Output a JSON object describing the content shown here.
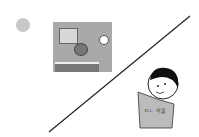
{
  "step_number": "3",
  "scene_1": {
    "description": "boy at desk in room with window and clock"
  },
  "scene_2": {
    "description": "boy reading a book",
    "book_text": "ㅁㄴ 식물"
  },
  "divider": "diagonal line"
}
